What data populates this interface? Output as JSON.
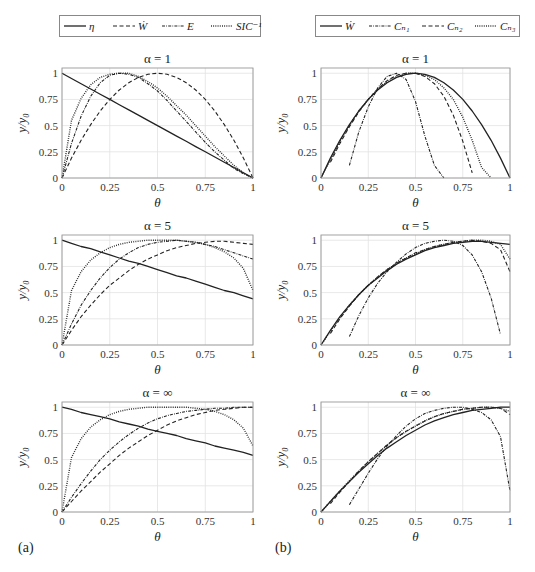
{
  "figure": {
    "panel_labels": [
      "(a)",
      "(b)"
    ]
  },
  "chart_data": [
    {
      "panel": "a",
      "type": "line",
      "title": "α = 1",
      "xlabel": "θ",
      "ylabel": "y/y₀",
      "xlim": [
        0,
        1
      ],
      "ylim": [
        0,
        1.05
      ],
      "xticks": [
        "0",
        "0.25",
        "0.5",
        "0.75",
        "1"
      ],
      "yticks": [
        "0",
        "0.25",
        "0.5",
        "0.75",
        "1"
      ],
      "grid": true,
      "legend": [
        "η",
        "Ẇ",
        "E",
        "SIC⁻¹"
      ],
      "x": [
        0,
        0.05,
        0.1,
        0.15,
        0.2,
        0.25,
        0.3,
        0.35,
        0.4,
        0.45,
        0.5,
        0.55,
        0.6,
        0.65,
        0.7,
        0.75,
        0.8,
        0.85,
        0.9,
        0.95,
        1
      ],
      "series": [
        {
          "name": "η",
          "style": "solid",
          "values": [
            1,
            0.95,
            0.9,
            0.85,
            0.8,
            0.75,
            0.7,
            0.65,
            0.6,
            0.55,
            0.5,
            0.45,
            0.4,
            0.35,
            0.3,
            0.25,
            0.2,
            0.15,
            0.1,
            0.05,
            0
          ]
        },
        {
          "name": "Ẇ",
          "style": "dashed",
          "values": [
            0,
            0.19,
            0.36,
            0.51,
            0.64,
            0.75,
            0.84,
            0.91,
            0.96,
            0.99,
            1,
            0.99,
            0.96,
            0.91,
            0.84,
            0.75,
            0.64,
            0.51,
            0.36,
            0.19,
            0
          ]
        },
        {
          "name": "E",
          "style": "dashdot",
          "values": [
            0,
            0.33,
            0.59,
            0.78,
            0.91,
            0.98,
            1,
            0.99,
            0.96,
            0.9,
            0.83,
            0.74,
            0.64,
            0.54,
            0.44,
            0.34,
            0.25,
            0.17,
            0.09,
            0.04,
            0
          ]
        },
        {
          "name": "SIC⁻¹",
          "style": "dotted",
          "values": [
            0,
            0.55,
            0.76,
            0.89,
            0.96,
            0.99,
            1,
            1,
            0.97,
            0.92,
            0.86,
            0.78,
            0.69,
            0.6,
            0.5,
            0.4,
            0.3,
            0.21,
            0.12,
            0.05,
            0
          ]
        }
      ]
    },
    {
      "panel": "a",
      "type": "line",
      "title": "α = 5",
      "xlabel": "θ",
      "ylabel": "y/y₀",
      "xlim": [
        0,
        1
      ],
      "ylim": [
        0,
        1.05
      ],
      "xticks": [
        "0",
        "0.25",
        "0.5",
        "0.75",
        "1"
      ],
      "yticks": [
        "0",
        "0.25",
        "0.5",
        "0.75",
        "1"
      ],
      "grid": true,
      "x": [
        0,
        0.05,
        0.1,
        0.15,
        0.2,
        0.25,
        0.3,
        0.35,
        0.4,
        0.45,
        0.5,
        0.55,
        0.6,
        0.65,
        0.7,
        0.75,
        0.8,
        0.85,
        0.9,
        0.95,
        1
      ],
      "series": [
        {
          "name": "η",
          "style": "solid",
          "values": [
            1,
            0.97,
            0.94,
            0.92,
            0.89,
            0.86,
            0.83,
            0.8,
            0.78,
            0.75,
            0.72,
            0.69,
            0.66,
            0.64,
            0.61,
            0.58,
            0.55,
            0.52,
            0.5,
            0.47,
            0.44
          ]
        },
        {
          "name": "Ẇ",
          "style": "dashed",
          "values": [
            0,
            0.14,
            0.27,
            0.38,
            0.48,
            0.57,
            0.64,
            0.71,
            0.77,
            0.82,
            0.86,
            0.9,
            0.93,
            0.95,
            0.97,
            0.98,
            0.99,
            0.99,
            0.98,
            0.97,
            0.96
          ]
        },
        {
          "name": "E",
          "style": "dashdot",
          "values": [
            0,
            0.2,
            0.38,
            0.52,
            0.64,
            0.74,
            0.82,
            0.88,
            0.93,
            0.96,
            0.98,
            0.99,
            1,
            0.99,
            0.98,
            0.96,
            0.94,
            0.91,
            0.88,
            0.85,
            0.82
          ]
        },
        {
          "name": "SIC⁻¹",
          "style": "dotted",
          "values": [
            0,
            0.52,
            0.7,
            0.81,
            0.88,
            0.93,
            0.96,
            0.98,
            0.99,
            1,
            1,
            1,
            1,
            0.99,
            0.98,
            0.96,
            0.93,
            0.89,
            0.83,
            0.73,
            0.52
          ]
        }
      ]
    },
    {
      "panel": "a",
      "type": "line",
      "title": "α = ∞",
      "xlabel": "θ",
      "ylabel": "y/y₀",
      "xlim": [
        0,
        1
      ],
      "ylim": [
        0,
        1.05
      ],
      "xticks": [
        "0",
        "0.25",
        "0.5",
        "0.75",
        "1"
      ],
      "yticks": [
        "0",
        "0.25",
        "0.5",
        "0.75",
        "1"
      ],
      "grid": true,
      "x": [
        0,
        0.05,
        0.1,
        0.15,
        0.2,
        0.25,
        0.3,
        0.35,
        0.4,
        0.45,
        0.5,
        0.55,
        0.6,
        0.65,
        0.7,
        0.75,
        0.8,
        0.85,
        0.9,
        0.95,
        1
      ],
      "series": [
        {
          "name": "η",
          "style": "solid",
          "values": [
            1,
            0.98,
            0.95,
            0.93,
            0.91,
            0.89,
            0.86,
            0.84,
            0.82,
            0.79,
            0.77,
            0.75,
            0.73,
            0.7,
            0.68,
            0.66,
            0.63,
            0.61,
            0.59,
            0.57,
            0.54
          ]
        },
        {
          "name": "Ẇ",
          "style": "dashed",
          "values": [
            0,
            0.1,
            0.2,
            0.29,
            0.38,
            0.46,
            0.54,
            0.61,
            0.67,
            0.73,
            0.78,
            0.83,
            0.87,
            0.9,
            0.93,
            0.95,
            0.97,
            0.98,
            0.99,
            1,
            1
          ]
        },
        {
          "name": "E",
          "style": "dashdot",
          "values": [
            0,
            0.14,
            0.27,
            0.39,
            0.5,
            0.59,
            0.67,
            0.74,
            0.8,
            0.85,
            0.89,
            0.92,
            0.94,
            0.96,
            0.97,
            0.98,
            0.99,
            0.99,
            1,
            1,
            1
          ]
        },
        {
          "name": "SIC⁻¹",
          "style": "dotted",
          "values": [
            0,
            0.52,
            0.7,
            0.81,
            0.88,
            0.93,
            0.96,
            0.98,
            0.99,
            1,
            1,
            1,
            1,
            1,
            0.99,
            0.98,
            0.96,
            0.93,
            0.88,
            0.8,
            0.63
          ]
        }
      ]
    },
    {
      "panel": "b",
      "type": "line",
      "title": "α = 1",
      "xlabel": "θ",
      "ylabel": "y/y₀",
      "xlim": [
        0,
        1
      ],
      "ylim": [
        0,
        1.05
      ],
      "xticks": [
        "0",
        "0.25",
        "0.5",
        "0.75",
        "1"
      ],
      "yticks": [
        "0",
        "0.25",
        "0.5",
        "0.75",
        "1"
      ],
      "grid": true,
      "legend": [
        "Ẇ",
        "Cₙ₁",
        "Cₙ₂",
        "Cₙ₃"
      ],
      "x": [
        0,
        0.05,
        0.1,
        0.15,
        0.2,
        0.25,
        0.3,
        0.35,
        0.4,
        0.45,
        0.5,
        0.55,
        0.6,
        0.65,
        0.7,
        0.75,
        0.8,
        0.85,
        0.9,
        0.95,
        1
      ],
      "series": [
        {
          "name": "Ẇ",
          "style": "solid",
          "values": [
            0,
            0.19,
            0.36,
            0.51,
            0.64,
            0.75,
            0.84,
            0.91,
            0.96,
            0.99,
            1,
            0.99,
            0.96,
            0.91,
            0.84,
            0.75,
            0.64,
            0.51,
            0.36,
            0.19,
            0
          ]
        },
        {
          "name": "Cₙ₁",
          "style": "dashdot",
          "values": [
            null,
            null,
            null,
            0.12,
            0.44,
            0.68,
            0.86,
            0.97,
            1,
            0.94,
            0.73,
            0.4,
            0.12,
            0,
            null,
            null,
            null,
            null,
            null,
            null,
            null
          ]
        },
        {
          "name": "Cₙ₂",
          "style": "dashed",
          "values": [
            null,
            0.15,
            0.33,
            0.49,
            0.63,
            0.75,
            0.85,
            0.93,
            0.98,
            1,
            1,
            0.97,
            0.9,
            0.78,
            0.6,
            0.35,
            0.05,
            null,
            null,
            null,
            null
          ]
        },
        {
          "name": "Cₙ₃",
          "style": "dotted",
          "values": [
            0,
            0.17,
            0.35,
            0.5,
            0.64,
            0.75,
            0.85,
            0.92,
            0.97,
            1,
            1,
            0.98,
            0.94,
            0.86,
            0.75,
            0.58,
            0.36,
            0.1,
            0,
            null,
            null
          ]
        }
      ]
    },
    {
      "panel": "b",
      "type": "line",
      "title": "α = 5",
      "xlabel": "θ",
      "ylabel": "y/y₀",
      "xlim": [
        0,
        1
      ],
      "ylim": [
        0,
        1.05
      ],
      "xticks": [
        "0",
        "0.25",
        "0.5",
        "0.75",
        "1"
      ],
      "yticks": [
        "0",
        "0.25",
        "0.5",
        "0.75",
        "1"
      ],
      "grid": true,
      "x": [
        0,
        0.05,
        0.1,
        0.15,
        0.2,
        0.25,
        0.3,
        0.35,
        0.4,
        0.45,
        0.5,
        0.55,
        0.6,
        0.65,
        0.7,
        0.75,
        0.8,
        0.85,
        0.9,
        0.95,
        1
      ],
      "series": [
        {
          "name": "Ẇ",
          "style": "solid",
          "values": [
            0,
            0.14,
            0.27,
            0.38,
            0.48,
            0.57,
            0.64,
            0.71,
            0.77,
            0.82,
            0.86,
            0.9,
            0.93,
            0.95,
            0.97,
            0.98,
            0.99,
            0.99,
            0.98,
            0.97,
            0.96
          ]
        },
        {
          "name": "Cₙ₁",
          "style": "dashdot",
          "values": [
            null,
            null,
            null,
            0.08,
            0.28,
            0.45,
            0.59,
            0.7,
            0.79,
            0.87,
            0.93,
            0.97,
            0.99,
            1,
            0.99,
            0.95,
            0.86,
            0.7,
            0.45,
            0.1,
            null
          ]
        },
        {
          "name": "Cₙ₂",
          "style": "dashed",
          "values": [
            null,
            0.11,
            0.25,
            0.37,
            0.48,
            0.57,
            0.65,
            0.72,
            0.78,
            0.83,
            0.88,
            0.91,
            0.94,
            0.96,
            0.98,
            0.99,
            1,
            0.99,
            0.97,
            0.91,
            0.7
          ]
        },
        {
          "name": "Cₙ₃",
          "style": "dotted",
          "values": [
            0,
            0.13,
            0.26,
            0.38,
            0.48,
            0.57,
            0.65,
            0.72,
            0.78,
            0.83,
            0.87,
            0.91,
            0.94,
            0.96,
            0.98,
            0.99,
            1,
            1,
            0.99,
            0.96,
            0.82
          ]
        }
      ]
    },
    {
      "panel": "b",
      "type": "line",
      "title": "α = ∞",
      "xlabel": "θ",
      "ylabel": "y/y₀",
      "xlim": [
        0,
        1
      ],
      "ylim": [
        0,
        1.05
      ],
      "xticks": [
        "0",
        "0.25",
        "0.5",
        "0.75",
        "1"
      ],
      "yticks": [
        "0",
        "0.25",
        "0.5",
        "0.75",
        "1"
      ],
      "grid": true,
      "x": [
        0,
        0.05,
        0.1,
        0.15,
        0.2,
        0.25,
        0.3,
        0.35,
        0.4,
        0.45,
        0.5,
        0.55,
        0.6,
        0.65,
        0.7,
        0.75,
        0.8,
        0.85,
        0.9,
        0.95,
        1
      ],
      "series": [
        {
          "name": "Ẇ",
          "style": "solid",
          "values": [
            0,
            0.1,
            0.2,
            0.29,
            0.38,
            0.46,
            0.54,
            0.61,
            0.67,
            0.73,
            0.78,
            0.83,
            0.87,
            0.9,
            0.93,
            0.95,
            0.97,
            0.98,
            0.99,
            1,
            1
          ]
        },
        {
          "name": "Cₙ₁",
          "style": "dashdot",
          "values": [
            null,
            null,
            null,
            0.07,
            0.22,
            0.37,
            0.51,
            0.63,
            0.73,
            0.82,
            0.89,
            0.94,
            0.97,
            0.99,
            1,
            1,
            0.98,
            0.95,
            0.88,
            0.72,
            0.2
          ]
        },
        {
          "name": "Cₙ₂",
          "style": "dashed",
          "values": [
            null,
            0.08,
            0.19,
            0.29,
            0.39,
            0.48,
            0.56,
            0.64,
            0.71,
            0.77,
            0.82,
            0.87,
            0.91,
            0.94,
            0.96,
            0.98,
            0.99,
            1,
            1,
            0.99,
            0.93
          ]
        },
        {
          "name": "Cₙ₃",
          "style": "dotted",
          "values": [
            0,
            0.1,
            0.2,
            0.3,
            0.39,
            0.48,
            0.56,
            0.64,
            0.71,
            0.77,
            0.82,
            0.87,
            0.91,
            0.94,
            0.96,
            0.98,
            0.99,
            1,
            1,
            0.99,
            0.96
          ]
        }
      ]
    }
  ]
}
